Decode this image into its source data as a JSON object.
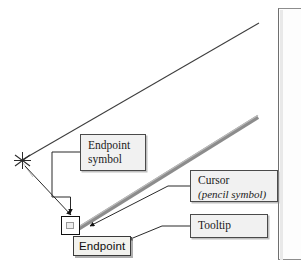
{
  "figure": {
    "width": 301,
    "height": 267,
    "background": "#ffffff",
    "alt": "CAD drawing area showing a rubber-band line being drawn to an endpoint snap, with annotation callouts"
  },
  "colors": {
    "ink": "#1a1a1a",
    "callout_fill": "#f1f1f1",
    "callout_border": "#4a4a4a",
    "pencil_trail": "#8c8c8c",
    "tooltip_fill": "#f2f2ee",
    "tooltip_border": "#3a3a3a",
    "panel_edge": "#6f6f6f",
    "existing_line": "#3d3d3d"
  },
  "callouts": [
    {
      "id": "endpoint-symbol",
      "line1": "Endpoint",
      "line2": "symbol",
      "italic": false
    },
    {
      "id": "cursor",
      "line1": "Cursor",
      "line2": "(pencil symbol)",
      "italic": true
    },
    {
      "id": "tooltip",
      "line1": "Tooltip",
      "line2": "",
      "italic": false
    }
  ],
  "tooltip": {
    "text": "Endpoint"
  },
  "drawing": {
    "existing_line": {
      "name": "existing-line",
      "from": [
        22,
        160
      ],
      "to": [
        259,
        23
      ]
    },
    "rubber_band_line": {
      "name": "pencil-drag-line",
      "from": [
        77,
        228
      ],
      "to": [
        258,
        117
      ],
      "color": "#8c8c8c",
      "width": 4
    },
    "endpoint_marker": {
      "name": "endpoint-snap-marker",
      "x": 61,
      "y": 216,
      "size": 19
    },
    "vertex_marker": {
      "name": "vertex-asterisk-marker",
      "x": 22,
      "y": 160
    },
    "cursor_tip": {
      "name": "pencil-cursor-tip",
      "x": 85,
      "y": 227
    }
  },
  "leaders": [
    {
      "name": "leader-vertex-to-endpoint",
      "points": "24,165 72,218"
    },
    {
      "name": "leader-endpoint-symbol",
      "points": "80,152 52,152 52,197 71,197 71,214"
    },
    {
      "name": "leader-cursor",
      "points": "190,186 168,186 88,226"
    },
    {
      "name": "leader-tooltip",
      "points": "190,226 163,226 126,241"
    }
  ],
  "panel": {
    "name": "right-dialog-panel-edge"
  }
}
